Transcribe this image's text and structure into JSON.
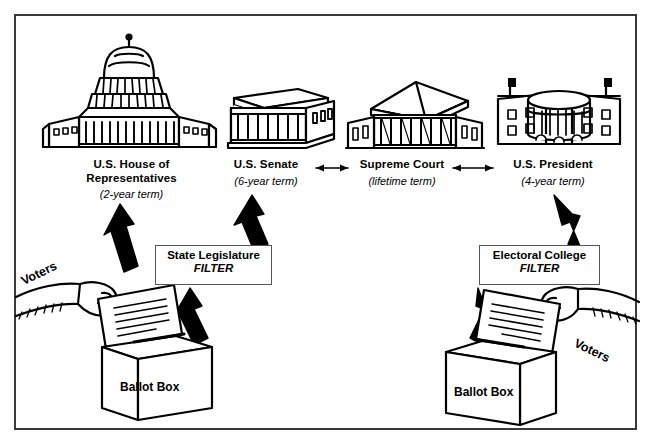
{
  "diagram": {
    "frame_border_color": "#3a3a3a",
    "ink_color": "#000000",
    "background": "#ffffff",
    "branches": [
      {
        "id": "house",
        "icon": "capitol-dome-building-icon",
        "name": "U.S. House of Representatives",
        "name_line1": "U.S. House of",
        "name_line2": "Representatives",
        "term": "(2-year term)"
      },
      {
        "id": "senate",
        "icon": "senate-colonnade-building-icon",
        "name": "U.S. Senate",
        "name_line1": "U.S. Senate",
        "name_line2": "",
        "term": "(6-year term)"
      },
      {
        "id": "supreme-court",
        "icon": "supreme-court-pediment-building-icon",
        "name": "Supreme Court",
        "name_line1": "Supreme Court",
        "name_line2": "",
        "term": "(lifetime term)"
      },
      {
        "id": "president",
        "icon": "white-house-building-icon",
        "name": "U.S. President",
        "name_line1": "U.S. President",
        "name_line2": "",
        "term": "(4-year term)"
      }
    ],
    "filters": [
      {
        "id": "state-legislature",
        "title": "State Legislature",
        "subtitle": "FILTER"
      },
      {
        "id": "electoral-college",
        "title": "Electoral College",
        "subtitle": "FILTER"
      }
    ],
    "ballot_boxes": [
      {
        "id": "ballot-box-left",
        "label": "Ballot Box",
        "voters_label": "Voters"
      },
      {
        "id": "ballot-box-right",
        "label": "Ballot Box",
        "voters_label": "Voters"
      }
    ],
    "connectors": [
      {
        "id": "senate-supreme-court",
        "style": "double-headed-arrow"
      },
      {
        "id": "supreme-court-president",
        "style": "double-headed-arrow"
      },
      {
        "id": "ballot-left-to-house",
        "style": "thick-block-arrow"
      },
      {
        "id": "ballot-left-to-state-legislature",
        "style": "thick-block-arrow"
      },
      {
        "id": "state-legislature-to-senate",
        "style": "thick-block-arrow"
      },
      {
        "id": "ballot-right-to-electoral-college",
        "style": "thick-block-arrow"
      },
      {
        "id": "electoral-college-to-president",
        "style": "thick-block-arrow"
      }
    ]
  }
}
